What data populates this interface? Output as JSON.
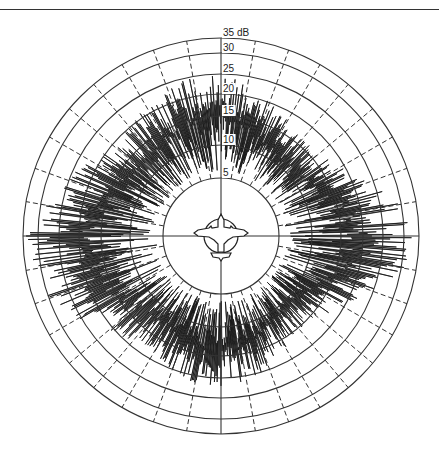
{
  "chart_data": {
    "type": "polar",
    "title": "",
    "radial_unit": "dB",
    "radial_ticks": [
      5,
      10,
      15,
      20,
      25,
      30,
      35
    ],
    "radial_tick_labels": [
      "5",
      "10",
      "15",
      "20",
      "25",
      "30",
      "35 dB"
    ],
    "rlim": [
      0,
      35
    ],
    "angular_grid_step_deg": 10,
    "solid_axes_deg": [
      0,
      90,
      180,
      270
    ],
    "grid": true,
    "center_icon": "aircraft-top-view",
    "geometry": {
      "cx": 221,
      "cy": 236,
      "ring_radii_px": [
        58,
        91,
        120,
        142,
        162,
        183,
        198
      ],
      "icon_circle_r": 17
    },
    "series": [
      {
        "name": "RCS",
        "style": "dense spiky radial trace",
        "envelope_deg_db": [
          [
            0,
            26
          ],
          [
            10,
            24
          ],
          [
            20,
            20
          ],
          [
            30,
            18
          ],
          [
            40,
            17
          ],
          [
            50,
            17
          ],
          [
            60,
            19
          ],
          [
            70,
            24
          ],
          [
            80,
            30
          ],
          [
            90,
            33
          ],
          [
            100,
            31
          ],
          [
            110,
            26
          ],
          [
            120,
            20
          ],
          [
            130,
            16
          ],
          [
            140,
            16
          ],
          [
            150,
            17
          ],
          [
            160,
            20
          ],
          [
            170,
            22
          ],
          [
            180,
            22
          ],
          [
            190,
            22
          ],
          [
            200,
            20
          ],
          [
            210,
            19
          ],
          [
            220,
            19
          ],
          [
            230,
            21
          ],
          [
            240,
            26
          ],
          [
            250,
            30
          ],
          [
            260,
            32
          ],
          [
            270,
            34
          ],
          [
            280,
            31
          ],
          [
            290,
            26
          ],
          [
            300,
            22
          ],
          [
            310,
            20
          ],
          [
            320,
            20
          ],
          [
            330,
            22
          ],
          [
            340,
            24
          ],
          [
            350,
            26
          ]
        ],
        "floor_db": 6
      }
    ]
  },
  "labels": {
    "r35": "35 dB",
    "r30": "30",
    "r25": "25",
    "r20": "20",
    "r15": "15",
    "r10": "10",
    "r5": "5"
  }
}
